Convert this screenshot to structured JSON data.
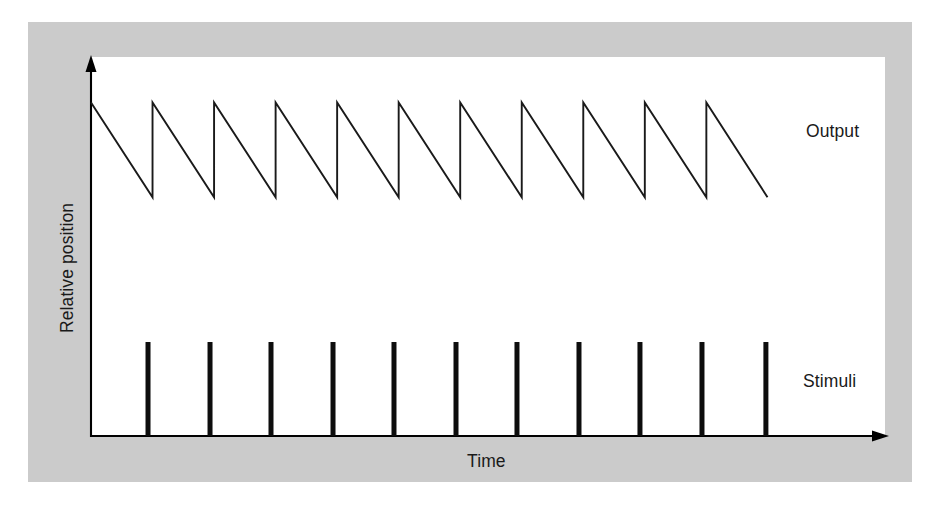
{
  "figure": {
    "panel_background": "#cbcbcb",
    "plot_background": "#ffffff",
    "line_color": "#1a1a1a",
    "axis_color": "#000000",
    "stimulus_color": "#0d0d0d"
  },
  "labels": {
    "output": "Output",
    "stimuli": "Stimuli",
    "time": "Time",
    "relative_position": "Relative position"
  },
  "caption": {
    "sliver_text": ""
  },
  "chart_data": {
    "type": "line",
    "title": "",
    "subtitle": "",
    "xlabel": "Time",
    "ylabel": "Relative position",
    "grid": false,
    "legend_position": "right-inline",
    "axes": {
      "x_axis": {
        "label": "Time",
        "ticks": [],
        "arrow": true,
        "range_note": "unitless, increasing to the right"
      },
      "y_axis": {
        "label": "Relative position",
        "ticks": [],
        "arrow": true,
        "range_note": "unitless, increasing upward"
      }
    },
    "annotations": [
      {
        "text": "Output",
        "target_series": "Output",
        "position": "right of waveform"
      },
      {
        "text": "Stimuli",
        "target_series": "Stimuli",
        "position": "right of pulse train"
      }
    ],
    "series": [
      {
        "name": "Output",
        "type": "sawtooth",
        "description": "Descending sawtooth ramp: slow linear decay then instantaneous reset upward at each stimulus",
        "cycles": 11,
        "peak_y": 0.88,
        "trough_y": 0.63,
        "period_x": 0.0775,
        "x_start": 0.0,
        "x_end": 0.852,
        "points": [
          {
            "x": 0.0,
            "y": 0.88
          },
          {
            "x": 0.0775,
            "y": 0.63
          },
          {
            "x": 0.0775,
            "y": 0.88
          },
          {
            "x": 0.155,
            "y": 0.63
          },
          {
            "x": 0.155,
            "y": 0.88
          },
          {
            "x": 0.2325,
            "y": 0.63
          },
          {
            "x": 0.2325,
            "y": 0.88
          },
          {
            "x": 0.31,
            "y": 0.63
          },
          {
            "x": 0.31,
            "y": 0.88
          },
          {
            "x": 0.3875,
            "y": 0.63
          },
          {
            "x": 0.3875,
            "y": 0.88
          },
          {
            "x": 0.465,
            "y": 0.63
          },
          {
            "x": 0.465,
            "y": 0.88
          },
          {
            "x": 0.5425,
            "y": 0.63
          },
          {
            "x": 0.5425,
            "y": 0.88
          },
          {
            "x": 0.62,
            "y": 0.63
          },
          {
            "x": 0.62,
            "y": 0.88
          },
          {
            "x": 0.6975,
            "y": 0.63
          },
          {
            "x": 0.6975,
            "y": 0.88
          },
          {
            "x": 0.775,
            "y": 0.63
          },
          {
            "x": 0.775,
            "y": 0.88
          },
          {
            "x": 0.852,
            "y": 0.63
          }
        ]
      },
      {
        "name": "Stimuli",
        "type": "pulse-train",
        "description": "Eleven evenly spaced vertical impulse bars rising from the time axis",
        "count": 11,
        "bar_top_y": 0.248,
        "bar_base_y": 0.0,
        "bar_width_x": 0.0063,
        "x_positions": [
          0.0718,
          0.1499,
          0.2267,
          0.3048,
          0.3816,
          0.4597,
          0.5365,
          0.6146,
          0.6914,
          0.7695,
          0.85
        ]
      }
    ]
  }
}
